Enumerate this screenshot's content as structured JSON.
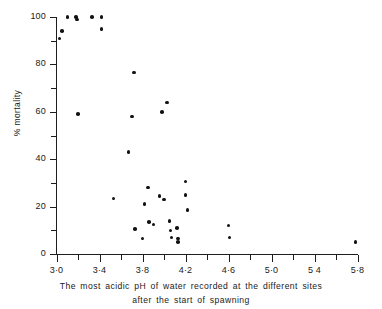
{
  "chart_data": {
    "type": "scatter",
    "title": "",
    "xlabel": "The most acidic pH of water recorded at the different sites after the start of spawning",
    "xlabel_line1": "The most acidic  pH of water  recorded at  the  different sites",
    "xlabel_line2": "after  the  start  of  spawning",
    "ylabel": "% mortality",
    "xlim": [
      3.0,
      5.8
    ],
    "ylim": [
      0,
      100
    ],
    "grid": false,
    "legend_position": "none",
    "x_tick_labels": [
      "3·0",
      "3·4",
      "3·8",
      "4·2",
      "4·6",
      "5·0",
      "5 4",
      "5·8"
    ],
    "x_tick_values": [
      3.0,
      3.4,
      3.8,
      4.2,
      4.6,
      5.0,
      5.4,
      5.8
    ],
    "x_minor_tick_values": [
      3.2,
      3.6,
      4.0,
      4.4,
      4.8,
      5.2,
      5.6
    ],
    "y_tick_labels": [
      "0",
      "20",
      "40",
      "60",
      "80",
      "100"
    ],
    "y_tick_values": [
      0,
      20,
      40,
      60,
      80,
      100
    ],
    "y_minor_tick_values": [
      10,
      30,
      50,
      70,
      90
    ],
    "marker": "filled-circle",
    "marker_color": "#121212",
    "axis_color": "#1d1d1d",
    "background_color": "#ffffff",
    "n_points": 34,
    "points": [
      {
        "x": 3.03,
        "y": 91
      },
      {
        "x": 3.05,
        "y": 94
      },
      {
        "x": 3.1,
        "y": 100
      },
      {
        "x": 3.18,
        "y": 100
      },
      {
        "x": 3.19,
        "y": 99
      },
      {
        "x": 3.2,
        "y": 59
      },
      {
        "x": 3.33,
        "y": 100
      },
      {
        "x": 3.42,
        "y": 100
      },
      {
        "x": 3.42,
        "y": 95
      },
      {
        "x": 3.53,
        "y": 23.5
      },
      {
        "x": 3.67,
        "y": 43
      },
      {
        "x": 3.7,
        "y": 58
      },
      {
        "x": 3.72,
        "y": 76.5
      },
      {
        "x": 3.73,
        "y": 10.5
      },
      {
        "x": 3.8,
        "y": 6.5
      },
      {
        "x": 3.82,
        "y": 21
      },
      {
        "x": 3.85,
        "y": 28
      },
      {
        "x": 3.86,
        "y": 13.5
      },
      {
        "x": 3.9,
        "y": 12.5
      },
      {
        "x": 3.96,
        "y": 24.5
      },
      {
        "x": 3.98,
        "y": 60
      },
      {
        "x": 4.0,
        "y": 23
      },
      {
        "x": 4.03,
        "y": 64
      },
      {
        "x": 4.05,
        "y": 14
      },
      {
        "x": 4.06,
        "y": 10
      },
      {
        "x": 4.07,
        "y": 7
      },
      {
        "x": 4.12,
        "y": 11
      },
      {
        "x": 4.13,
        "y": 6.5
      },
      {
        "x": 4.13,
        "y": 5
      },
      {
        "x": 4.2,
        "y": 30.5
      },
      {
        "x": 4.2,
        "y": 25
      },
      {
        "x": 4.22,
        "y": 18.5
      },
      {
        "x": 4.6,
        "y": 12
      },
      {
        "x": 4.61,
        "y": 7
      },
      {
        "x": 5.78,
        "y": 5
      }
    ]
  }
}
